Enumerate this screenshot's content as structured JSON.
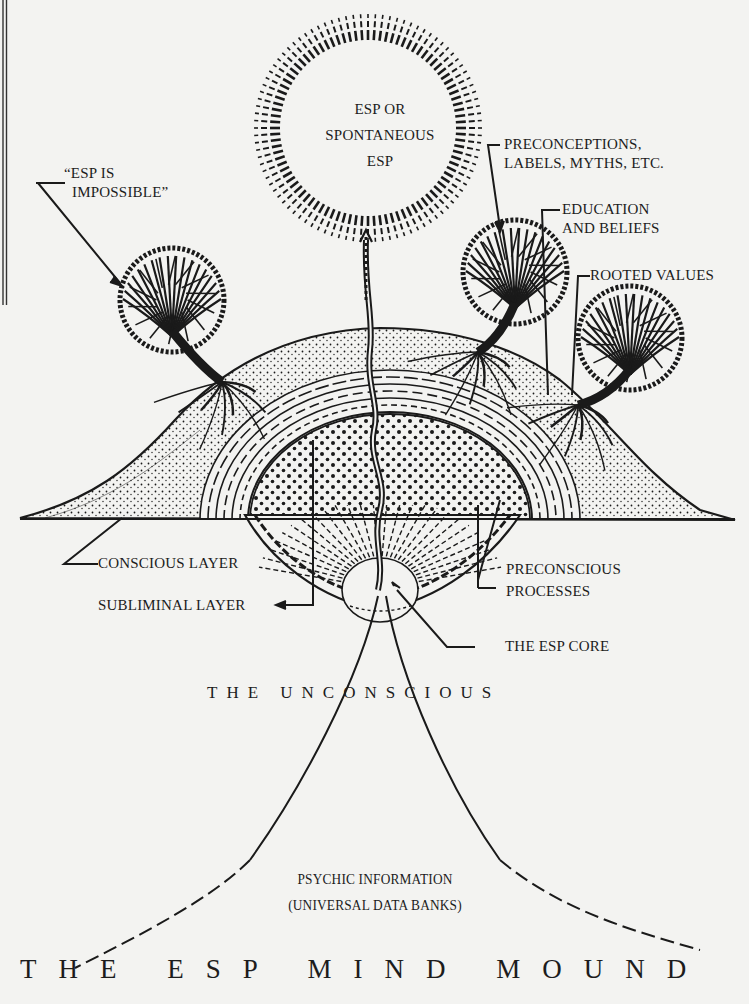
{
  "diagram": {
    "title": "THE ESP MIND MOUND",
    "colors": {
      "paper": "#f3f3f1",
      "ink": "#1a1a1a"
    },
    "sun": {
      "lines": [
        "ESP OR",
        "SPONTANEOUS",
        "ESP"
      ]
    },
    "labels": {
      "esp_impossible": [
        "“ESP IS",
        "IMPOSSIBLE”"
      ],
      "preconceptions": [
        "PRECONCEPTIONS,",
        "LABELS, MYTHS, ETC."
      ],
      "education": [
        "EDUCATION",
        "AND BELIEFS"
      ],
      "rooted_values": "ROOTED VALUES",
      "conscious_layer": "CONSCIOUS LAYER",
      "subliminal_layer": "SUBLIMINAL LAYER",
      "preconscious": [
        "PRECONSCIOUS",
        "PROCESSES"
      ],
      "esp_core": "THE ESP CORE",
      "unconscious": "THE UNCONSCIOUS",
      "psychic_info": [
        "PSYCHIC INFORMATION",
        "(UNIVERSAL DATA BANKS)"
      ]
    }
  }
}
